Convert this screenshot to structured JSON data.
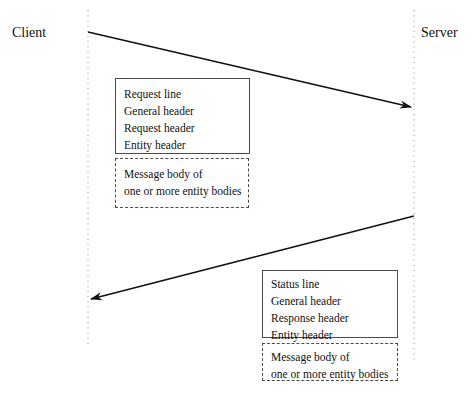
{
  "diagram": {
    "background_color": "#ffffff",
    "line_color": "#111111",
    "box_border_color": "#4a4a4a",
    "lifeline_color": "#9a9a9a"
  },
  "actors": {
    "client": {
      "label": "Client",
      "lifeline_x": 88
    },
    "server": {
      "label": "Server",
      "lifeline_x": 414
    }
  },
  "arrows": [
    {
      "name": "request-arrow",
      "direction": "client-to-server",
      "from": {
        "x": 88,
        "y": 32
      },
      "to": {
        "x": 414,
        "y": 108
      }
    },
    {
      "name": "response-arrow",
      "direction": "server-to-client",
      "from": {
        "x": 414,
        "y": 216
      },
      "to": {
        "x": 88,
        "y": 300
      }
    }
  ],
  "request_message": {
    "headers": {
      "style": "solid",
      "lines": [
        "Request line",
        "General header",
        "Request header",
        "Entity header"
      ]
    },
    "body": {
      "style": "dashed",
      "lines": [
        "Message body of",
        "one or more entity bodies"
      ]
    }
  },
  "response_message": {
    "headers": {
      "style": "solid",
      "lines": [
        "Status line",
        "General header",
        "Response header",
        "Entity header"
      ]
    },
    "body": {
      "style": "dashed",
      "lines": [
        "Message body of",
        "one or more entity bodies"
      ]
    }
  }
}
